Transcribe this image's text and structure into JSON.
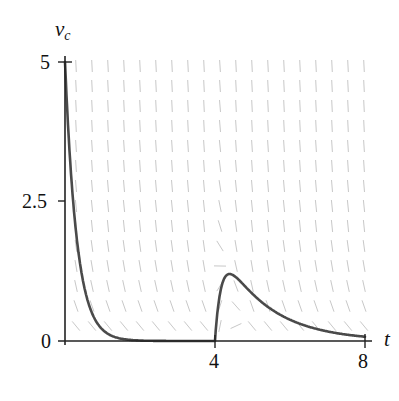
{
  "chart_data": {
    "type": "line",
    "title": "",
    "xlabel": "t",
    "ylabel": "v",
    "ylabel_subscript": "c",
    "xlim": [
      0,
      8
    ],
    "ylim": [
      0,
      5
    ],
    "x_ticks": [
      {
        "value": 0,
        "label": ""
      },
      {
        "value": 4,
        "label": "4"
      },
      {
        "value": 8,
        "label": "8"
      }
    ],
    "y_ticks": [
      {
        "value": 0,
        "label": "0"
      },
      {
        "value": 2.5,
        "label": "2.5"
      },
      {
        "value": 5,
        "label": "5"
      }
    ],
    "grid": false,
    "background": "slope field (direction field) of short gray segments",
    "series": [
      {
        "name": "capacitor voltage v_c(t)",
        "description": "decays from 5 at t=0 to ~0 by t≈1.5, stays at 0 until t=4, then rises sharply to a peak ≈1.2 near t≈4.4 and decays to ≈0.08 at t=8",
        "points": [
          [
            0,
            5.0
          ],
          [
            0.1,
            3.63
          ],
          [
            0.2,
            2.64
          ],
          [
            0.3,
            1.91
          ],
          [
            0.4,
            1.39
          ],
          [
            0.5,
            1.01
          ],
          [
            0.6,
            0.73
          ],
          [
            0.8,
            0.39
          ],
          [
            1.0,
            0.2
          ],
          [
            1.2,
            0.11
          ],
          [
            1.5,
            0.04
          ],
          [
            2.0,
            0.01
          ],
          [
            3.0,
            0.0
          ],
          [
            4.0,
            0.0
          ],
          [
            4.1,
            0.68
          ],
          [
            4.2,
            1.0
          ],
          [
            4.3,
            1.14
          ],
          [
            4.4,
            1.19
          ],
          [
            4.5,
            1.19
          ],
          [
            4.75,
            1.11
          ],
          [
            5.0,
            0.98
          ],
          [
            5.5,
            0.73
          ],
          [
            6.0,
            0.38
          ],
          [
            6.5,
            0.27
          ],
          [
            7.0,
            0.17
          ],
          [
            7.5,
            0.12
          ],
          [
            8.0,
            0.08
          ]
        ],
        "color": "#4a4a4a"
      }
    ]
  },
  "colors": {
    "curve": "#4a4a4a",
    "axis": "#222222",
    "field": "#c8c8c8"
  },
  "labels": {
    "y_axis_main": "v",
    "y_axis_sub": "c",
    "x_axis": "t",
    "y_tick_5": "5",
    "y_tick_2_5": "2.5",
    "y_tick_0": "0",
    "x_tick_4": "4",
    "x_tick_8": "8"
  }
}
